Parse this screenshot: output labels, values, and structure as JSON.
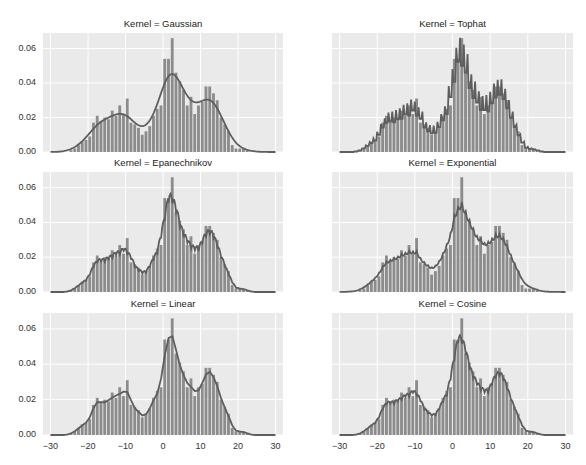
{
  "chart_data": [
    {
      "type": "bar",
      "title": "Kernel = Gaussian",
      "kernel": "Gaussian"
    },
    {
      "type": "bar",
      "title": "Kernel = Tophat",
      "kernel": "Tophat"
    },
    {
      "type": "bar",
      "title": "Kernel = Epanechnikov",
      "kernel": "Epanechnikov"
    },
    {
      "type": "bar",
      "title": "Kernel = Exponential",
      "kernel": "Exponential"
    },
    {
      "type": "bar",
      "title": "Kernel = Linear",
      "kernel": "Linear"
    },
    {
      "type": "bar",
      "title": "Kernel = Cosine",
      "kernel": "Cosine"
    }
  ],
  "shared": {
    "description": "Histogram (density) of a trimodal sample with kernel density estimate overlay, one panel per kernel",
    "xlim": [
      -32,
      32
    ],
    "ylim": [
      0,
      0.069
    ],
    "xticks": [
      -30,
      -20,
      -10,
      0,
      10,
      20,
      30
    ],
    "xtick_labels": [
      "−30",
      "−20",
      "−10",
      "0",
      "10",
      "20",
      "30"
    ],
    "yticks": [
      0.0,
      0.02,
      0.04,
      0.06
    ],
    "ytick_labels": [
      "0.00",
      "0.02",
      "0.04",
      "0.06"
    ],
    "grid": true,
    "sharex": true,
    "sharey": true,
    "histogram": {
      "bin_start": -25,
      "bin_width": 1,
      "density": [
        0.001,
        0.002,
        0.004,
        0.006,
        0.007,
        0.009,
        0.017,
        0.021,
        0.018,
        0.02,
        0.019,
        0.024,
        0.021,
        0.027,
        0.022,
        0.031,
        0.017,
        0.016,
        0.014,
        0.01,
        0.012,
        0.015,
        0.021,
        0.025,
        0.027,
        0.054,
        0.054,
        0.066,
        0.046,
        0.041,
        0.036,
        0.027,
        0.032,
        0.022,
        0.027,
        0.029,
        0.038,
        0.038,
        0.034,
        0.03,
        0.02,
        0.016,
        0.012,
        0.004,
        0.002,
        0.002,
        0.002,
        0.001
      ]
    }
  },
  "colors": {
    "bar": "#8c8c8c",
    "curve": "#5e5e5e",
    "axes_bg": "#eaeaea",
    "grid": "#ffffff"
  }
}
